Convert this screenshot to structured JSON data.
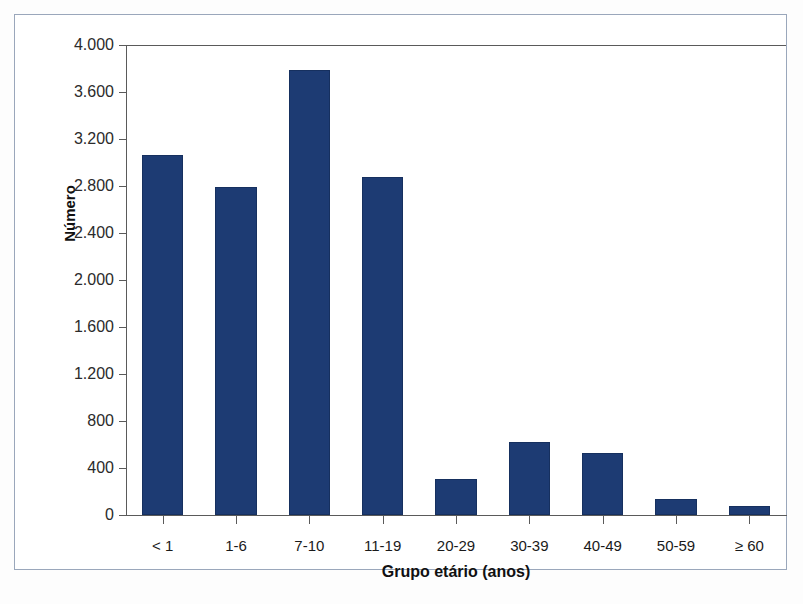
{
  "chart_data": {
    "type": "bar",
    "title": "",
    "xlabel": "Grupo etário (anos)",
    "ylabel": "Número",
    "categories": [
      "< 1",
      "1-6",
      "7-10",
      "11-19",
      "20-29",
      "30-39",
      "40-49",
      "50-59",
      "≥ 60"
    ],
    "values": [
      3060,
      2790,
      3790,
      2880,
      310,
      620,
      530,
      140,
      80
    ],
    "ylim": [
      0,
      4000
    ],
    "y_ticks": [
      0,
      400,
      800,
      1200,
      1600,
      2000,
      2400,
      2800,
      3200,
      3600,
      4000
    ],
    "y_tick_labels": [
      "0",
      "400",
      "800",
      "1.200",
      "1.600",
      "2.000",
      "2.400",
      "2.800",
      "3.200",
      "3.600",
      "4.000"
    ],
    "grid": false,
    "legend": null,
    "bar_color": "#1d3b73",
    "bar_border_color": "#16305f",
    "axis_color": "#5a5a5a",
    "frame_color": "#9aa7bb",
    "background": "#ffffff"
  },
  "axes": {
    "y_title": "Número",
    "x_title": "Grupo etário (anos)"
  },
  "y_labels": {
    "t0": "4.000",
    "t1": "3.600",
    "t2": "3.200",
    "t3": "2.800",
    "t4": "2.400",
    "t5": "2.000",
    "t6": "1.600",
    "t7": "1.200",
    "t8": "800",
    "t9": "400",
    "t10": "0"
  },
  "x_labels": {
    "c0": "< 1",
    "c1": "1-6",
    "c2": "7-10",
    "c3": "11-19",
    "c4": "20-29",
    "c5": "30-39",
    "c6": "40-49",
    "c7": "50-59",
    "c8": "≥ 60"
  }
}
